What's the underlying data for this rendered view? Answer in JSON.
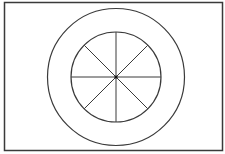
{
  "diagram": {
    "type": "concentric-circles-with-spokes",
    "background": "#ffffff",
    "stroke_color": "#3a3a3a",
    "frame": {
      "x": 4.5,
      "y": 2.5,
      "width": 218,
      "height": 148,
      "stroke_width": 1.5
    },
    "center": {
      "x": 116,
      "y": 77
    },
    "outer_circle": {
      "radius": 68.5,
      "stroke_width": 1.2
    },
    "inner_circle": {
      "radius": 45,
      "stroke_width": 1.2
    },
    "spokes": {
      "count": 8,
      "angles_deg": [
        0,
        45,
        90,
        135,
        180,
        225,
        270,
        315
      ],
      "stroke_width": 1
    },
    "center_dot": {
      "radius": 1.6
    }
  }
}
